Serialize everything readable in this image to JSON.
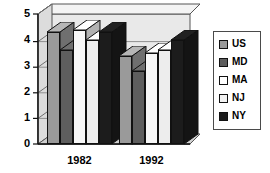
{
  "chart_data": {
    "type": "bar",
    "title": "",
    "xlabel": "",
    "ylabel": "",
    "categories": [
      "1982",
      "1992"
    ],
    "ylim": [
      0,
      5
    ],
    "yticks": [
      "0",
      "1",
      "2",
      "3",
      "4",
      "5"
    ],
    "grid": true,
    "legend_position": "right",
    "three_d": true,
    "series": [
      {
        "name": "US",
        "color": "#9a9a9a",
        "values": [
          4.3,
          3.4
        ]
      },
      {
        "name": "MD",
        "color": "#5e5e5e",
        "values": [
          3.6,
          2.8
        ]
      },
      {
        "name": "MA",
        "color": "#f7f7f7",
        "values": [
          4.4,
          3.5
        ]
      },
      {
        "name": "NJ",
        "color": "#ededed",
        "values": [
          4.0,
          3.6
        ]
      },
      {
        "name": "NY",
        "color": "#1c1c1c",
        "values": [
          4.3,
          4.0
        ]
      }
    ]
  },
  "legend": {
    "items": [
      {
        "label": "US",
        "color": "#9a9a9a"
      },
      {
        "label": "MD",
        "color": "#5e5e5e"
      },
      {
        "label": "MA",
        "color": "#ffffff"
      },
      {
        "label": "NJ",
        "color": "#f2f2f2"
      },
      {
        "label": "NY",
        "color": "#1c1c1c"
      }
    ]
  }
}
